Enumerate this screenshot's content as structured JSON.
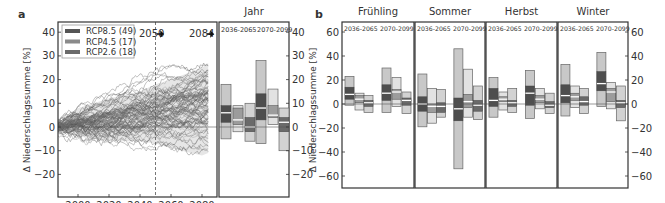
{
  "panels": {
    "a": {
      "label": "a",
      "box_title": "Jahr"
    },
    "b": {
      "label": "b"
    }
  },
  "legend": [
    {
      "name": "RCP8.5 (49)",
      "color": "#555555"
    },
    {
      "name": "RCP4.5 (17)",
      "color": "#8a8a8a"
    },
    {
      "name": "RCP2.6 (18)",
      "color": "#6a6a6a"
    }
  ],
  "annotations": {
    "y2050": "2050",
    "y2084": "2084"
  },
  "period_labels": [
    "2036-2065",
    "2070-2099"
  ],
  "ylabel": "Δ Niederschlagssumme [%]",
  "chart_data": [
    {
      "type": "line",
      "title": "",
      "panel": "a",
      "xlabel": "",
      "ylabel": "Δ Niederschlagssumme [%]",
      "xlim": [
        1985,
        2085
      ],
      "ylim": [
        -25,
        44
      ],
      "xticks": [
        2000,
        2020,
        2040,
        2060,
        2080
      ],
      "yticks": [
        -20,
        -10,
        0,
        10,
        20,
        30,
        40
      ],
      "legend": [
        "RCP8.5 (49)",
        "RCP4.5 (17)",
        "RCP2.6 (18)"
      ],
      "legend_position": "upper left",
      "description": "Ensemble of 84 precipitation change trajectories starting at 0 in ~1985 and fanning out; by 2084 spread about -13 to +27 %",
      "vline": 2050,
      "envelope": {
        "x": [
          1985,
          2000,
          2020,
          2040,
          2050,
          2060,
          2080,
          2084
        ],
        "upper": [
          0,
          8,
          12,
          15,
          18,
          20,
          25,
          27
        ],
        "lower": [
          0,
          -4,
          -6,
          -6,
          -7,
          -9,
          -12,
          -11
        ]
      }
    },
    {
      "type": "box",
      "panel": "a",
      "title": "Jahr",
      "categories": [
        "2036-2065",
        "2070-2099"
      ],
      "series_order": [
        "RCP8.5",
        "RCP4.5",
        "RCP2.6"
      ],
      "ylim": [
        -25,
        44
      ],
      "boxes": [
        {
          "period": "2036-2065",
          "series": "RCP8.5",
          "min": -5,
          "q1": 2,
          "median": 6,
          "q3": 9,
          "max": 18
        },
        {
          "period": "2036-2065",
          "series": "RCP4.5",
          "min": -2,
          "q1": 1,
          "median": 3,
          "q3": 8,
          "max": 9
        },
        {
          "period": "2036-2065",
          "series": "RCP2.6",
          "min": -6,
          "q1": -2,
          "median": 0,
          "q3": 4,
          "max": 10
        },
        {
          "period": "2070-2099",
          "series": "RCP8.5",
          "min": -7,
          "q1": 3,
          "median": 8,
          "q3": 14,
          "max": 28
        },
        {
          "period": "2070-2099",
          "series": "RCP4.5",
          "min": 1,
          "q1": 4,
          "median": 5,
          "q3": 9,
          "max": 16
        },
        {
          "period": "2070-2099",
          "series": "RCP2.6",
          "min": -10,
          "q1": -2,
          "median": 2,
          "q3": 4,
          "max": 8
        }
      ]
    },
    {
      "type": "box",
      "panel": "b",
      "ylim": [
        -70,
        65
      ],
      "yticks": [
        -60,
        -40,
        -20,
        0,
        20,
        40,
        60
      ],
      "groups": [
        "Frühling",
        "Sommer",
        "Herbst",
        "Winter"
      ],
      "categories": [
        "2036-2065",
        "2070-2099"
      ],
      "series_order": [
        "RCP8.5",
        "RCP4.5",
        "RCP2.6"
      ],
      "boxes": {
        "Frühling": [
          {
            "min": -1,
            "q1": 4,
            "median": 8,
            "q3": 14,
            "max": 23
          },
          {
            "min": -5,
            "q1": 1,
            "median": 4,
            "q3": 7,
            "max": 9
          },
          {
            "min": -7,
            "q1": -2,
            "median": 1,
            "q3": 3,
            "max": 7
          },
          {
            "min": -7,
            "q1": 3,
            "median": 9,
            "q3": 16,
            "max": 30
          },
          {
            "min": -2,
            "q1": 4,
            "median": 10,
            "q3": 12,
            "max": 22
          },
          {
            "min": -8,
            "q1": -1,
            "median": 3,
            "q3": 5,
            "max": 10
          }
        ],
        "Sommer": [
          {
            "min": -19,
            "q1": -6,
            "median": 0,
            "q3": 6,
            "max": 25
          },
          {
            "min": -16,
            "q1": -7,
            "median": -2,
            "q3": 0,
            "max": 13
          },
          {
            "min": -11,
            "q1": -7,
            "median": -2,
            "q3": 1,
            "max": 12
          },
          {
            "min": -54,
            "q1": -14,
            "median": -4,
            "q3": 5,
            "max": 46
          },
          {
            "min": -11,
            "q1": -3,
            "median": 2,
            "q3": 8,
            "max": 29
          },
          {
            "min": -13,
            "q1": -6,
            "median": -1,
            "q3": 3,
            "max": 15
          }
        ],
        "Herbst": [
          {
            "min": -11,
            "q1": -2,
            "median": 3,
            "q3": 13,
            "max": 22
          },
          {
            "min": -5,
            "q1": 2,
            "median": 4,
            "q3": 6,
            "max": 10
          },
          {
            "min": -7,
            "q1": -2,
            "median": 1,
            "q3": 3,
            "max": 13
          },
          {
            "min": -12,
            "q1": -1,
            "median": 9,
            "q3": 15,
            "max": 28
          },
          {
            "min": -4,
            "q1": 1,
            "median": 4,
            "q3": 7,
            "max": 13
          },
          {
            "min": -8,
            "q1": -3,
            "median": -1,
            "q3": 2,
            "max": 9
          }
        ],
        "Winter": [
          {
            "min": -10,
            "q1": 1,
            "median": 7,
            "q3": 16,
            "max": 33
          },
          {
            "min": -3,
            "q1": 3,
            "median": 6,
            "q3": 9,
            "max": 15
          },
          {
            "min": -8,
            "q1": -1,
            "median": 2,
            "q3": 6,
            "max": 13
          },
          {
            "min": -2,
            "q1": 11,
            "median": 17,
            "q3": 27,
            "max": 43
          },
          {
            "min": -4,
            "q1": 2,
            "median": 10,
            "q3": 13,
            "max": 18
          },
          {
            "min": -14,
            "q1": -3,
            "median": 1,
            "q3": 3,
            "max": 15
          }
        ]
      }
    }
  ]
}
